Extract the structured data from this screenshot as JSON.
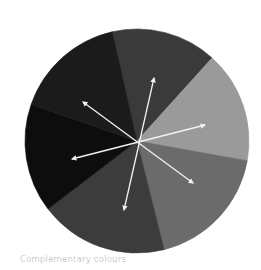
{
  "diagram": {
    "title": "Complementary colours",
    "type": "colour-wheel",
    "center": {
      "x": 137,
      "y": 141
    },
    "radius": 112,
    "segments": [
      {
        "name": "top",
        "color": "#3a3a3a",
        "from": [
          111,
          26
        ],
        "to": [
          212,
          58
        ]
      },
      {
        "name": "upper-right",
        "color": "#9a9a9a",
        "from": [
          212,
          58
        ],
        "to": [
          243,
          160
        ]
      },
      {
        "name": "lower-right",
        "color": "#6b6b6b",
        "from": [
          243,
          160
        ],
        "to": [
          164,
          249
        ]
      },
      {
        "name": "bottom",
        "color": "#3c3c3c",
        "from": [
          164,
          249
        ],
        "to": [
          48,
          209
        ]
      },
      {
        "name": "left",
        "color": "#0d0d0d",
        "from": [
          48,
          209
        ],
        "to": [
          28,
          103
        ]
      },
      {
        "name": "upper-left",
        "color": "#1b1b1b",
        "from": [
          28,
          103
        ],
        "to": [
          111,
          26
        ]
      }
    ],
    "arrows": [
      {
        "name": "arrow-top-bottom",
        "from": [
          154,
          78
        ],
        "to": [
          124,
          210
        ]
      },
      {
        "name": "arrow-upper-left-lower-right",
        "from": [
          83,
          102
        ],
        "to": [
          193,
          183
        ]
      },
      {
        "name": "arrow-left-right",
        "from": [
          72,
          159
        ],
        "to": [
          205,
          125
        ]
      }
    ],
    "arrow_color": "#f2f2f2"
  }
}
